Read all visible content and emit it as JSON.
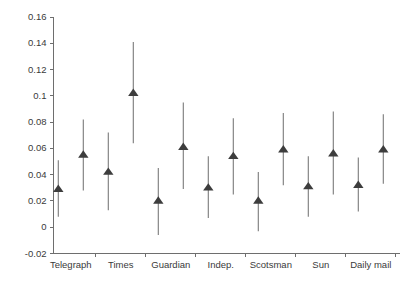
{
  "chart_data": {
    "type": "scatter",
    "title": "",
    "subtitle": "",
    "xlabel": "",
    "ylabel": "",
    "xlim": [
      0,
      15
    ],
    "ylim": [
      -0.02,
      0.16
    ],
    "grid": false,
    "legend": null,
    "marker_style": "filled-triangle",
    "error_bar_style": "vertical-line-no-caps",
    "y_ticks": [
      -0.02,
      0,
      0.02,
      0.04,
      0.06,
      0.08,
      0.1,
      0.12,
      0.14,
      0.16
    ],
    "y_tick_labels": [
      "-0.02",
      "0",
      "0.02",
      "0.04",
      "0.06",
      "0.08",
      "0.1",
      "0.12",
      "0.14",
      "0.16"
    ],
    "categories": [
      "Telegraph",
      "Times",
      "Guardian",
      "Indep.",
      "Scotsman",
      "Sun",
      "Daily mail"
    ],
    "x_tick_labels": [
      "Telegraph",
      "Times",
      "Guardian",
      "Indep.",
      "Scotsman",
      "Sun",
      "Daily mail"
    ],
    "points": [
      {
        "group": "Telegraph",
        "index": 1,
        "x": 1,
        "value": 0.029,
        "low": 0.008,
        "high": 0.051
      },
      {
        "group": "Telegraph",
        "index": 2,
        "x": 2,
        "value": 0.055,
        "low": 0.028,
        "high": 0.082
      },
      {
        "group": "Times",
        "index": 3,
        "x": 3,
        "value": 0.042,
        "low": 0.013,
        "high": 0.072
      },
      {
        "group": "Times",
        "index": 4,
        "x": 4,
        "value": 0.102,
        "low": 0.064,
        "high": 0.141
      },
      {
        "group": "Guardian",
        "index": 5,
        "x": 5,
        "value": 0.02,
        "low": -0.006,
        "high": 0.045
      },
      {
        "group": "Guardian",
        "index": 6,
        "x": 6,
        "value": 0.061,
        "low": 0.029,
        "high": 0.095
      },
      {
        "group": "Indep.",
        "index": 7,
        "x": 7,
        "value": 0.03,
        "low": 0.007,
        "high": 0.054
      },
      {
        "group": "Indep.",
        "index": 8,
        "x": 8,
        "value": 0.054,
        "low": 0.025,
        "high": 0.083
      },
      {
        "group": "Scotsman",
        "index": 9,
        "x": 9,
        "value": 0.02,
        "low": -0.003,
        "high": 0.042
      },
      {
        "group": "Scotsman",
        "index": 10,
        "x": 10,
        "value": 0.059,
        "low": 0.032,
        "high": 0.087
      },
      {
        "group": "Sun",
        "index": 11,
        "x": 11,
        "value": 0.031,
        "low": 0.008,
        "high": 0.054
      },
      {
        "group": "Sun",
        "index": 12,
        "x": 12,
        "value": 0.056,
        "low": 0.025,
        "high": 0.088
      },
      {
        "group": "Daily mail",
        "index": 13,
        "x": 13,
        "value": 0.032,
        "low": 0.012,
        "high": 0.053
      },
      {
        "group": "Daily mail",
        "index": 14,
        "x": 14,
        "value": 0.059,
        "low": 0.033,
        "high": 0.086
      }
    ],
    "colors": {
      "marker": "#3d3d3d",
      "error_bar": "#7a7a7a",
      "axis": "#6e6e6e",
      "text": "#3a3a3a",
      "background": "#ffffff"
    }
  }
}
